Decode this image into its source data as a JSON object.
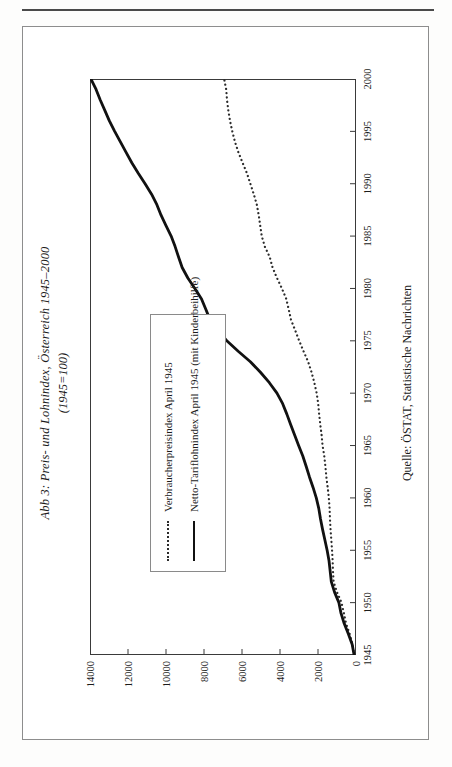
{
  "figure": {
    "title": "Abb 3: Preis- und Lohnindex, Österreich 1945–2000",
    "subtitle": "(1945=100)",
    "source": "Quelle: ÖSTAT, Statistische Nachrichten"
  },
  "legend": {
    "items": [
      {
        "label": "Verbraucherpreisindex April 1945",
        "style": "dotted"
      },
      {
        "label": "Netto-Tariflohnindex April 1945 (mit Kinderbeihilfe)",
        "style": "solid"
      }
    ]
  },
  "chart_data": {
    "type": "line",
    "title": "Abb 3: Preis- und Lohnindex, Österreich 1945–2000",
    "subtitle": "(1945=100)",
    "xlabel": "",
    "ylabel": "",
    "xlim": [
      1945,
      2000
    ],
    "ylim": [
      0,
      14000
    ],
    "xticks": [
      1945,
      1950,
      1955,
      1960,
      1965,
      1970,
      1975,
      1980,
      1985,
      1990,
      1995,
      2000
    ],
    "yticks": [
      0,
      2000,
      4000,
      6000,
      8000,
      10000,
      12000,
      14000
    ],
    "grid": false,
    "legend_position": "inside-left",
    "annotations": [
      "Quelle: ÖSTAT, Statistische Nachrichten"
    ],
    "x": [
      1945,
      1946,
      1947,
      1948,
      1949,
      1950,
      1951,
      1952,
      1953,
      1954,
      1955,
      1956,
      1957,
      1958,
      1959,
      1960,
      1961,
      1962,
      1963,
      1964,
      1965,
      1966,
      1967,
      1968,
      1969,
      1970,
      1971,
      1972,
      1973,
      1974,
      1975,
      1976,
      1977,
      1978,
      1979,
      1980,
      1981,
      1982,
      1983,
      1984,
      1985,
      1986,
      1987,
      1988,
      1989,
      1990,
      1991,
      1992,
      1993,
      1994,
      1995,
      1996,
      1997,
      1998,
      1999,
      2000
    ],
    "series": [
      {
        "name": "Verbraucherpreisindex April 1945",
        "style": "dotted",
        "color": "#2b2b2b",
        "values": [
          100,
          180,
          330,
          520,
          640,
          760,
          1000,
          1180,
          1210,
          1230,
          1260,
          1300,
          1340,
          1370,
          1390,
          1430,
          1490,
          1560,
          1610,
          1670,
          1760,
          1810,
          1880,
          1940,
          1990,
          2070,
          2190,
          2340,
          2520,
          2760,
          2990,
          3200,
          3420,
          3540,
          3670,
          3900,
          4160,
          4390,
          4540,
          4800,
          4960,
          5040,
          5120,
          5220,
          5380,
          5560,
          5740,
          5970,
          6190,
          6370,
          6510,
          6630,
          6720,
          6790,
          6830,
          6940
        ]
      },
      {
        "name": "Netto-Tariflohnindex April 1945 (mit Kinderbeihilfe)",
        "style": "solid",
        "color": "#111111",
        "values": [
          100,
          200,
          400,
          620,
          790,
          900,
          1130,
          1300,
          1360,
          1420,
          1520,
          1640,
          1760,
          1870,
          1960,
          2090,
          2260,
          2450,
          2620,
          2800,
          3020,
          3230,
          3440,
          3640,
          3860,
          4160,
          4560,
          5030,
          5560,
          6200,
          6800,
          7250,
          7680,
          7900,
          8130,
          8480,
          8850,
          9150,
          9340,
          9520,
          9730,
          10000,
          10260,
          10480,
          10760,
          11100,
          11460,
          11800,
          12100,
          12400,
          12700,
          12980,
          13220,
          13460,
          13680,
          13950
        ]
      }
    ]
  },
  "axes": {
    "x_tick_labels": [
      "1945",
      "1950",
      "1955",
      "1960",
      "1965",
      "1970",
      "1975",
      "1980",
      "1985",
      "1990",
      "1995",
      "2000"
    ],
    "y_tick_labels": [
      "0",
      "2000",
      "4000",
      "6000",
      "8000",
      "10000",
      "12000",
      "14000"
    ]
  }
}
